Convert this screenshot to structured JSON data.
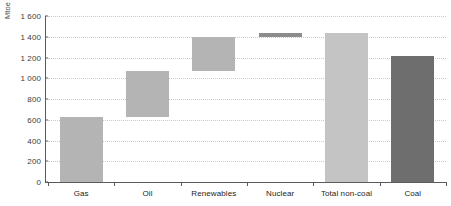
{
  "chart_data": {
    "type": "bar",
    "title": "",
    "subtitle": "",
    "xlabel": "",
    "ylabel": "Mtoe",
    "ylim": [
      0,
      1600
    ],
    "ytick_labels": [
      "0",
      "200",
      "400",
      "600",
      "800",
      "1 000",
      "1 200",
      "1 400",
      "1 600"
    ],
    "ytick_values": [
      0,
      200,
      400,
      600,
      800,
      1000,
      1200,
      1400,
      1600
    ],
    "grid": true,
    "grid_style": "dotted-horizontal",
    "legend": "none",
    "categories": [
      "Gas",
      "Oil",
      "Renewables",
      "Nuclear",
      "Total non-coal",
      "Coal"
    ],
    "waterfall": true,
    "bars": [
      {
        "label": "Gas",
        "base": 0,
        "top": 630,
        "value": 630,
        "color": "#b4b4b4"
      },
      {
        "label": "Oil",
        "base": 630,
        "top": 1070,
        "value": 440,
        "color": "#b4b4b4"
      },
      {
        "label": "Renewables",
        "base": 1070,
        "top": 1395,
        "value": 325,
        "color": "#b4b4b4"
      },
      {
        "label": "Nuclear",
        "base": 1395,
        "top": 1440,
        "value": 45,
        "color": "#8c8c8c"
      },
      {
        "label": "Total non-coal",
        "base": 0,
        "top": 1440,
        "value": 1440,
        "color": "#c4c4c4"
      },
      {
        "label": "Coal",
        "base": 0,
        "top": 1215,
        "value": 1215,
        "color": "#6e6e6e"
      }
    ],
    "values": [
      630,
      440,
      325,
      45,
      1440,
      1215
    ],
    "colors": {
      "bar_default": "#b4b4b4",
      "bar_nuclear": "#8c8c8c",
      "bar_total": "#c4c4c4",
      "bar_coal": "#6e6e6e",
      "axis": "#5a5a5a",
      "gridline": "#c9c9c9",
      "text": "#1d1d1d",
      "background": "#ffffff"
    }
  }
}
